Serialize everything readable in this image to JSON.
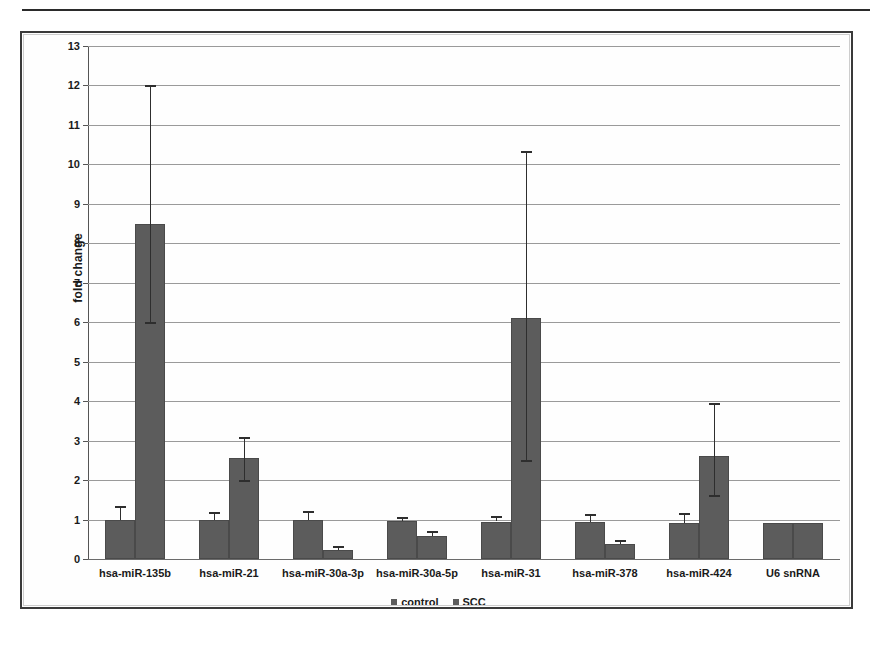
{
  "figure": {
    "has_top_rule": true,
    "frame_color": "#3a3a3a",
    "background": "#ffffff"
  },
  "chart_data": {
    "type": "bar",
    "title": "",
    "subtitle": "",
    "xlabel": "",
    "ylabel": "fold change",
    "ylim": [
      0,
      13
    ],
    "ytick_step": 1,
    "yticks": [
      "0",
      "1",
      "2",
      "3",
      "4",
      "5",
      "6",
      "7",
      "8",
      "9",
      "10",
      "11",
      "12",
      "13"
    ],
    "grid": true,
    "grid_axis": "y",
    "legend_position": "bottom-center",
    "bar_color": "#5c5c5c",
    "error_bar_color": "#2e2e2e",
    "categories": [
      "hsa-miR-135b",
      "hsa-miR-21",
      "hsa-miR-30a-3p",
      "hsa-miR-30a-5p",
      "hsa-miR-31",
      "hsa-miR-378",
      "hsa-miR-424",
      "U6 snRNA"
    ],
    "series": [
      {
        "name": "control",
        "values": [
          1.0,
          1.0,
          1.0,
          0.97,
          0.95,
          0.95,
          0.92,
          0.92
        ],
        "err_upper": [
          0.35,
          0.18,
          0.22,
          0.1,
          0.15,
          0.18,
          0.25,
          0.0
        ],
        "err_lower": [
          0.0,
          0.0,
          0.0,
          0.0,
          0.0,
          0.0,
          0.0,
          0.0
        ]
      },
      {
        "name": "SCC",
        "values": [
          8.5,
          2.55,
          0.22,
          0.58,
          6.1,
          0.37,
          2.62,
          0.92
        ],
        "err_upper": [
          3.5,
          0.55,
          0.1,
          0.12,
          4.25,
          0.12,
          1.33,
          0.0
        ],
        "err_lower": [
          2.5,
          0.55,
          0.0,
          0.0,
          3.6,
          0.0,
          1.0,
          0.0
        ]
      }
    ]
  },
  "legend": {
    "items": [
      {
        "label": "control",
        "color": "#5c5c5c"
      },
      {
        "label": "SCC",
        "color": "#5c5c5c"
      }
    ]
  }
}
